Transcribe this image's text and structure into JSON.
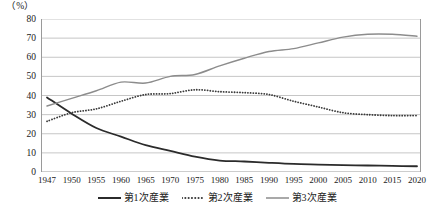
{
  "chart_data": {
    "type": "line",
    "title": "",
    "subtitle": "",
    "unit_label": "（%）",
    "xlabel": "",
    "ylabel": "",
    "ylim": [
      0,
      80
    ],
    "ytick_step": 10,
    "yticks": [
      "80",
      "70",
      "60",
      "50",
      "40",
      "30",
      "20",
      "10",
      "0"
    ],
    "grid": true,
    "grid_axis": "y",
    "legend_position": "bottom-center",
    "xlim": [
      1947,
      2020
    ],
    "xticks": [
      "1947",
      "1950",
      "1955",
      "1960",
      "1965",
      "1970",
      "1975",
      "1980",
      "1985",
      "1990",
      "1995",
      "2000",
      "2005",
      "2010",
      "2015",
      "2020"
    ],
    "x": [
      1947,
      1950,
      1955,
      1960,
      1965,
      1970,
      1975,
      1980,
      1985,
      1990,
      1995,
      2000,
      2005,
      2010,
      2015,
      2020
    ],
    "series": [
      {
        "name": "第1次産業",
        "style": "solid",
        "color": "#2b2b2b",
        "width": 1.8,
        "values": [
          39.0,
          30.5,
          23.0,
          18.5,
          14.0,
          11.0,
          8.0,
          6.0,
          5.5,
          4.8,
          4.2,
          3.9,
          3.6,
          3.4,
          3.2,
          3.0
        ]
      },
      {
        "name": "第2次産業",
        "style": "dotted",
        "color": "#3a3a3a",
        "width": 1.6,
        "values": [
          26.5,
          31.0,
          33.0,
          37.0,
          40.5,
          41.0,
          43.0,
          42.0,
          41.5,
          40.5,
          37.0,
          34.0,
          31.0,
          30.0,
          29.5,
          29.5
        ]
      },
      {
        "name": "第3次産業",
        "style": "solid",
        "color": "#8c8c8c",
        "width": 1.4,
        "values": [
          34.5,
          38.5,
          42.5,
          47.0,
          46.5,
          50.0,
          51.0,
          55.5,
          59.5,
          63.0,
          64.5,
          67.5,
          70.5,
          72.0,
          72.0,
          71.0
        ]
      }
    ],
    "annotations": []
  }
}
